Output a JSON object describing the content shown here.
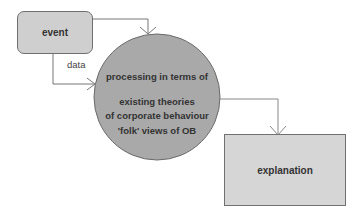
{
  "diagram": {
    "nodes": {
      "event": {
        "label": "event",
        "shape": "rounded-rectangle",
        "fill": "#cfcfcf"
      },
      "processing": {
        "shape": "circle",
        "fill": "#a9a9a9",
        "lines": [
          "processing in terms of",
          "existing theories",
          "of corporate behaviour",
          "'folk' views of OB"
        ]
      },
      "explanation": {
        "label": "explanation",
        "shape": "rectangle",
        "fill": "#d6d6d6"
      }
    },
    "edges": [
      {
        "from": "event",
        "to": "processing",
        "label": ""
      },
      {
        "from": "event",
        "to": "processing",
        "label": "data"
      },
      {
        "from": "processing",
        "to": "explanation",
        "label": ""
      }
    ],
    "edge_labels": {
      "data": "data"
    }
  }
}
